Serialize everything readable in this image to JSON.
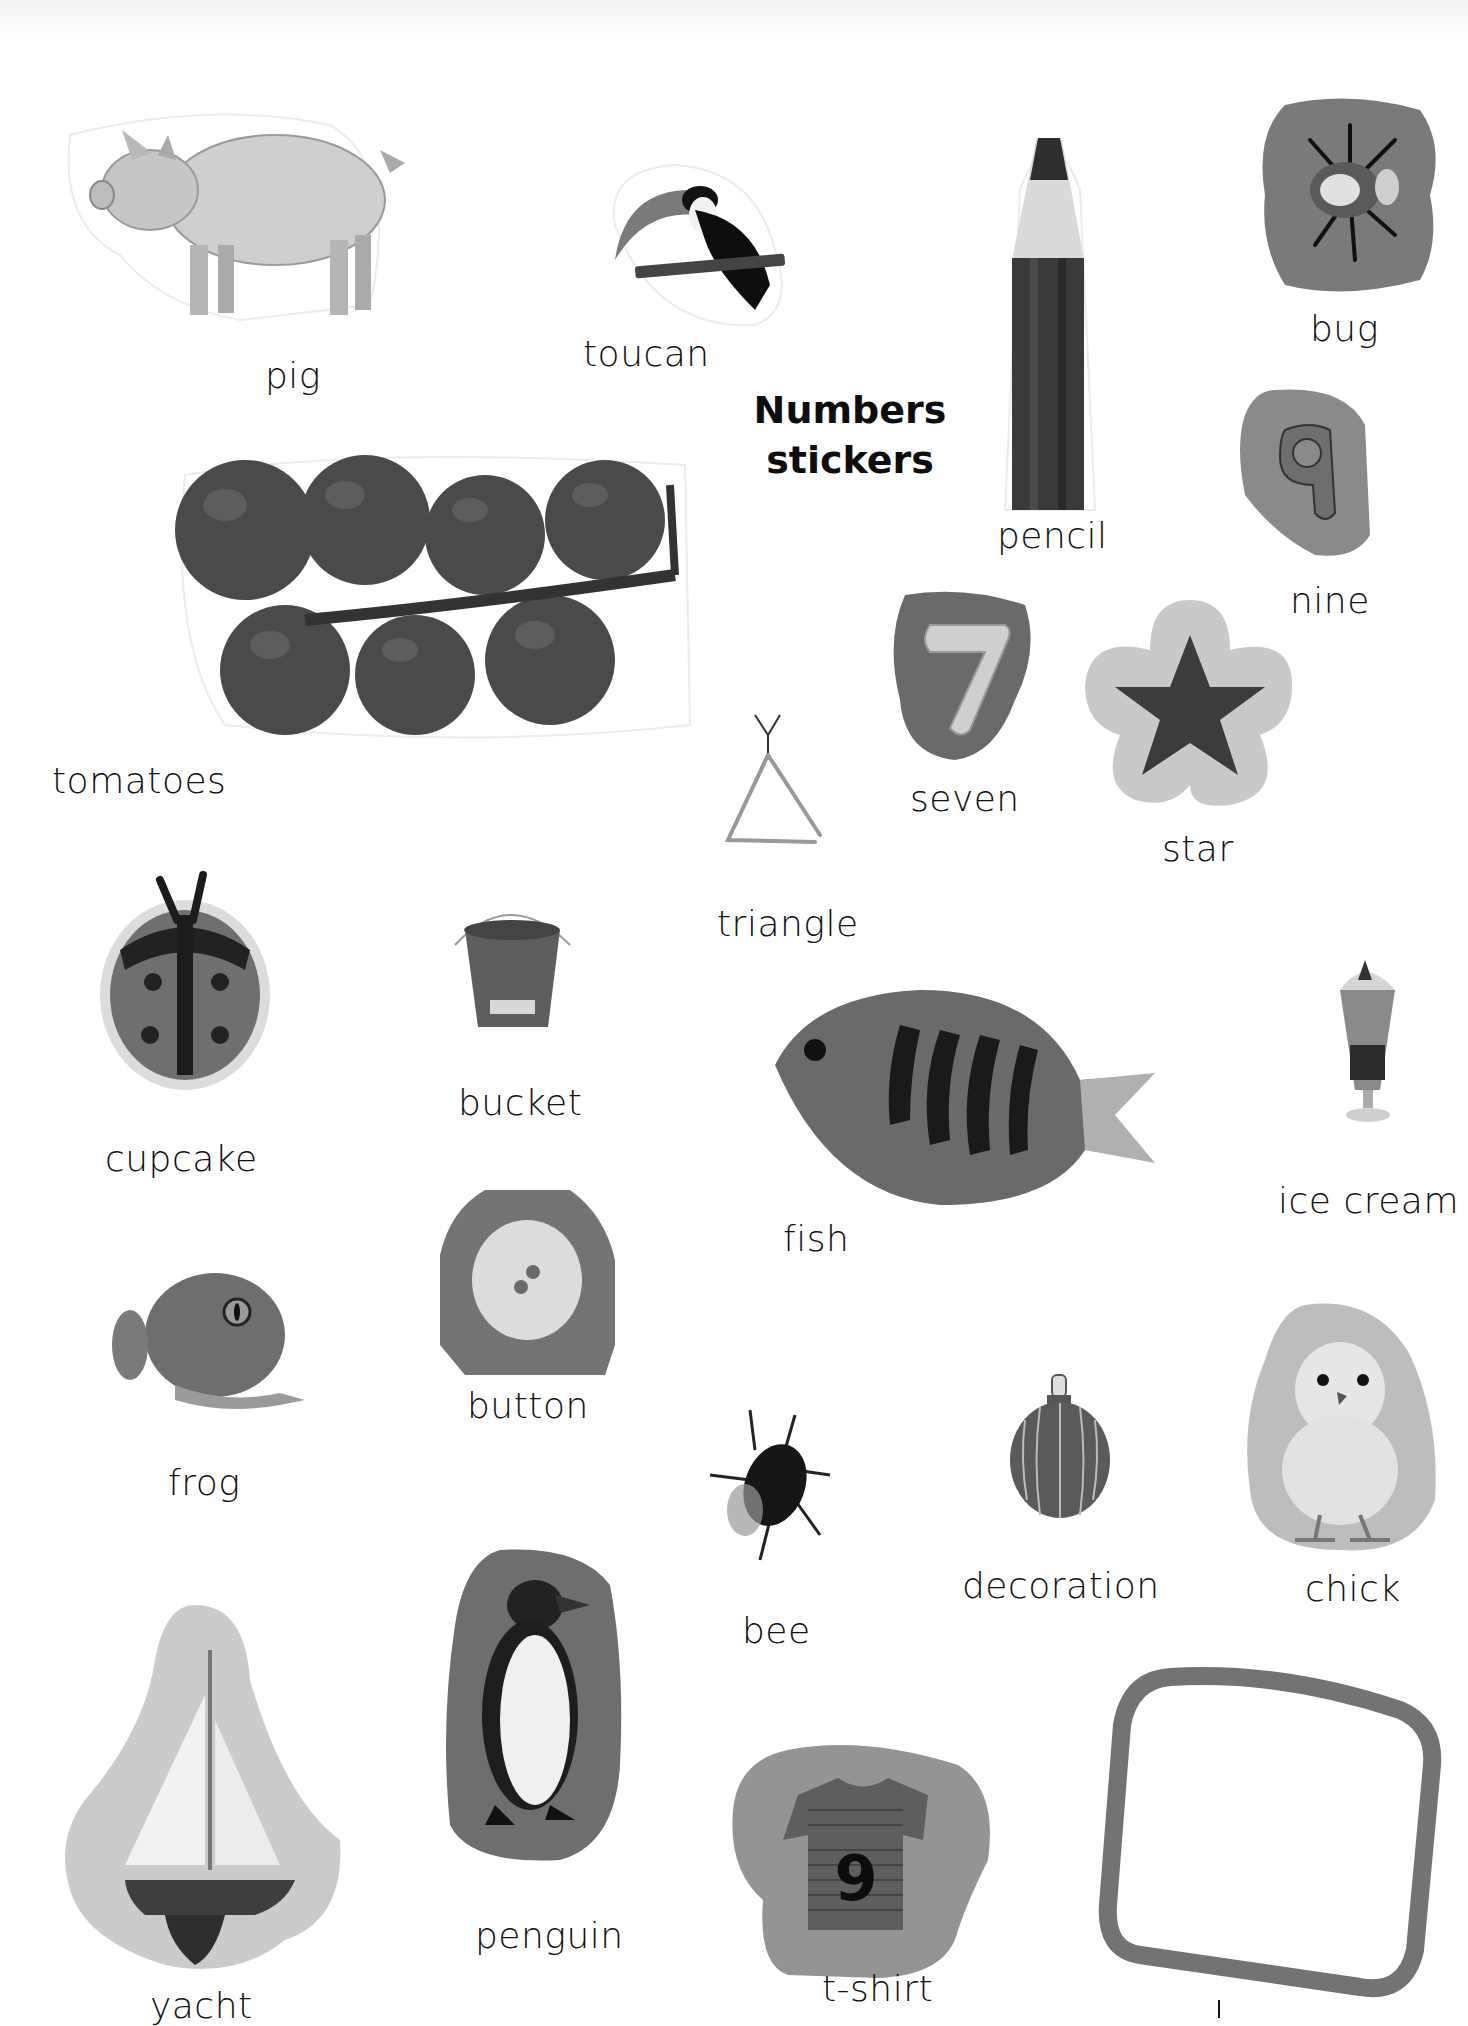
{
  "page": {
    "title_line1": "Numbers",
    "title_line2": "stickers",
    "background": "#ffffff"
  },
  "colors": {
    "sticker_dark": "#6b6b6b",
    "sticker_mid": "#8a8a8a",
    "sticker_light": "#c8c8c8",
    "frame": "#707070"
  },
  "stickers": [
    {
      "id": "pig",
      "label": "pig",
      "icon": "pig-icon"
    },
    {
      "id": "toucan",
      "label": "toucan",
      "icon": "toucan-icon"
    },
    {
      "id": "pencil",
      "label": "pencil",
      "icon": "pencil-icon"
    },
    {
      "id": "bug",
      "label": "bug",
      "icon": "bug-icon"
    },
    {
      "id": "nine",
      "label": "nine",
      "icon": "number-nine-icon",
      "glyph": "9"
    },
    {
      "id": "tomatoes",
      "label": "tomatoes",
      "icon": "tomatoes-icon"
    },
    {
      "id": "seven",
      "label": "seven",
      "icon": "number-seven-icon",
      "glyph": "7"
    },
    {
      "id": "star",
      "label": "star",
      "icon": "star-icon"
    },
    {
      "id": "triangle",
      "label": "triangle",
      "icon": "triangle-instrument-icon"
    },
    {
      "id": "cupcake",
      "label": "cupcake",
      "icon": "ladybird-cupcake-icon"
    },
    {
      "id": "bucket",
      "label": "bucket",
      "icon": "bucket-icon"
    },
    {
      "id": "fish",
      "label": "fish",
      "icon": "fish-icon"
    },
    {
      "id": "ice_cream",
      "label": "ice cream",
      "icon": "ice-cream-sundae-icon"
    },
    {
      "id": "frog",
      "label": "frog",
      "icon": "frog-icon"
    },
    {
      "id": "button",
      "label": "button",
      "icon": "button-icon"
    },
    {
      "id": "bee",
      "label": "bee",
      "icon": "bee-icon"
    },
    {
      "id": "decoration",
      "label": "decoration",
      "icon": "bauble-decoration-icon"
    },
    {
      "id": "chick",
      "label": "chick",
      "icon": "chick-icon"
    },
    {
      "id": "yacht",
      "label": "yacht",
      "icon": "yacht-icon"
    },
    {
      "id": "penguin",
      "label": "penguin",
      "icon": "penguin-icon"
    },
    {
      "id": "tshirt",
      "label": "t-shirt",
      "icon": "tshirt-icon",
      "glyph": "9"
    },
    {
      "id": "frame",
      "label": "",
      "icon": "square-frame-icon"
    }
  ]
}
